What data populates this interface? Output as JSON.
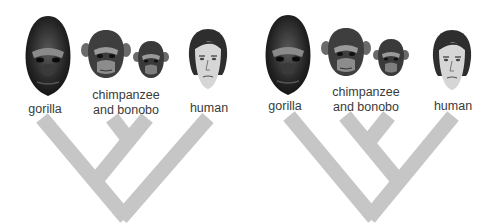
{
  "colors": {
    "branch": "#c6c6c6",
    "label": "#3a3a3a",
    "background": "#ffffff"
  },
  "panels": [
    {
      "id": "left",
      "description": "Chimpanzee and bonobo grouped with gorilla",
      "labels": {
        "gorilla": "gorilla",
        "chimp_line1": "chimpanzee",
        "chimp_line2": "and bonobo",
        "human": "human"
      },
      "faces": [
        "gorilla-face",
        "chimpanzee-face",
        "bonobo-face",
        "human-face"
      ]
    },
    {
      "id": "right",
      "description": "Chimpanzee and bonobo grouped with human",
      "labels": {
        "gorilla": "gorilla",
        "chimp_line1": "chimpanzee",
        "chimp_line2": "and bonobo",
        "human": "human"
      },
      "faces": [
        "gorilla-face",
        "chimpanzee-face",
        "bonobo-face",
        "human-face"
      ]
    }
  ]
}
